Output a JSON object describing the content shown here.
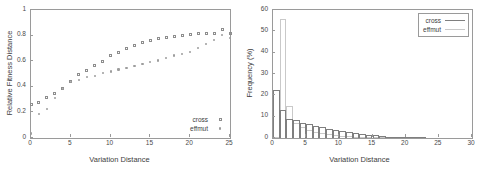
{
  "figure": {
    "panels": [
      "left",
      "right"
    ],
    "caption_fragment": ""
  },
  "chart_data": [
    {
      "id": "left",
      "type": "scatter",
      "title": "",
      "xlabel": "Variation Distance",
      "ylabel": "Relative Fitness Distance",
      "xlim": [
        0,
        25
      ],
      "ylim": [
        0,
        1
      ],
      "xticks": [
        0,
        5,
        10,
        15,
        20,
        25
      ],
      "yticks": [
        0,
        0.2,
        0.4,
        0.6,
        0.8,
        1
      ],
      "xtick_labels": [
        "0",
        "5",
        "10",
        "15",
        "20",
        "25"
      ],
      "ytick_labels": [
        "0",
        "0.2",
        "0.4",
        "0.6",
        "0.8",
        "1"
      ],
      "grid": false,
      "legend_position": "bottom-right-inside",
      "legend_boxed": false,
      "series": [
        {
          "name": "cross",
          "marker": "open-square",
          "color": "#8d8d8d",
          "x": [
            0,
            1,
            2,
            3,
            4,
            5,
            6,
            7,
            8,
            9,
            10,
            11,
            12,
            13,
            14,
            15,
            16,
            17,
            18,
            19,
            20,
            21,
            22,
            23,
            24,
            25
          ],
          "y": [
            0.26,
            0.28,
            0.32,
            0.345,
            0.39,
            0.44,
            0.5,
            0.525,
            0.565,
            0.6,
            0.645,
            0.665,
            0.7,
            0.725,
            0.745,
            0.765,
            0.775,
            0.785,
            0.795,
            0.8,
            0.81,
            0.815,
            0.815,
            0.82,
            0.845,
            0.82
          ]
        },
        {
          "name": "effmut",
          "marker": "dot",
          "color": "#9d9d9d",
          "x": [
            0,
            1,
            2,
            3,
            4,
            5,
            6,
            7,
            8,
            9,
            10,
            11,
            12,
            13,
            14,
            15,
            16,
            17,
            18,
            19,
            20,
            21,
            22,
            23,
            24,
            25
          ],
          "y": [
            0.035,
            0.185,
            0.225,
            0.31,
            0.385,
            0.44,
            0.455,
            0.475,
            0.485,
            0.505,
            0.52,
            0.535,
            0.545,
            0.565,
            0.58,
            0.595,
            0.605,
            0.625,
            0.645,
            0.655,
            0.675,
            0.705,
            0.735,
            0.765,
            0.805,
            0.78
          ]
        }
      ]
    },
    {
      "id": "right",
      "type": "bar",
      "title": "",
      "xlabel": "Variation Distance",
      "ylabel": "Frequency (%)",
      "xlim": [
        0,
        30
      ],
      "ylim": [
        0,
        60
      ],
      "xticks": [
        0,
        5,
        10,
        15,
        20,
        25,
        30
      ],
      "yticks": [
        0,
        10,
        20,
        30,
        40,
        50,
        60
      ],
      "xtick_labels": [
        "0",
        "5",
        "10",
        "15",
        "20",
        "25",
        "30"
      ],
      "ytick_labels": [
        "0",
        "10",
        "20",
        "30",
        "40",
        "50",
        "60"
      ],
      "grid": false,
      "legend_position": "top-right-inside",
      "legend_boxed": true,
      "categories": [
        0,
        1,
        2,
        3,
        4,
        5,
        6,
        7,
        8,
        9,
        10,
        11,
        12,
        13,
        14,
        15,
        16,
        17,
        18,
        19,
        20,
        21,
        22,
        23,
        24,
        25,
        26,
        27,
        28,
        29
      ],
      "series": [
        {
          "name": "cross",
          "style": "solid",
          "color": "#7f7f7f",
          "values": [
            22.5,
            13.0,
            9.0,
            8.5,
            7.2,
            6.4,
            5.8,
            5.0,
            4.4,
            3.8,
            3.3,
            2.8,
            2.3,
            1.9,
            1.5,
            1.2,
            0.9,
            0.7,
            0.5,
            0.35,
            0.25,
            0.18,
            0.12,
            0.08,
            0.05,
            0.04,
            0.03,
            0.02,
            0.01,
            0.01
          ]
        },
        {
          "name": "effmut",
          "style": "light",
          "color": "#c9c9c9",
          "values": [
            0.6,
            56.0,
            15.0,
            7.0,
            5.2,
            3.9,
            3.0,
            2.4,
            1.9,
            1.5,
            1.1,
            0.85,
            0.65,
            0.5,
            0.38,
            0.28,
            0.2,
            0.15,
            0.1,
            0.08,
            0.05,
            0.04,
            0.03,
            0.02,
            0.02,
            0.01,
            0.01,
            0.01,
            0.01,
            0.0
          ]
        }
      ]
    }
  ]
}
